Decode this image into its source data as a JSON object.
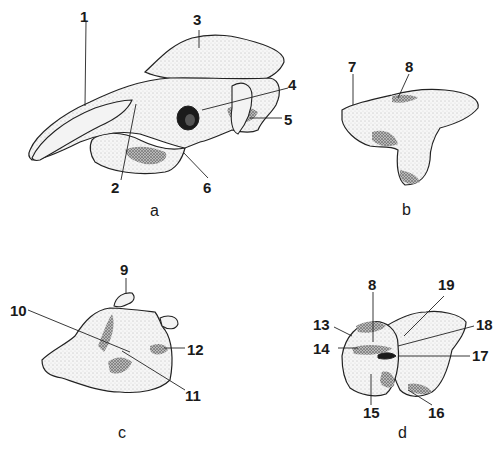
{
  "figure": {
    "type": "anatomical-illustration",
    "panels": [
      {
        "id": "a",
        "label": "a",
        "callouts": [
          "1",
          "2",
          "3",
          "4",
          "5",
          "6"
        ]
      },
      {
        "id": "b",
        "label": "b",
        "callouts": [
          "7",
          "8"
        ]
      },
      {
        "id": "c",
        "label": "c",
        "callouts": [
          "9",
          "10",
          "11",
          "12"
        ]
      },
      {
        "id": "d",
        "label": "d",
        "callouts": [
          "8",
          "13",
          "14",
          "15",
          "16",
          "17",
          "18",
          "19"
        ]
      }
    ]
  },
  "labels": {
    "a": {
      "panel": "a",
      "n1": "1",
      "n2": "2",
      "n3": "3",
      "n4": "4",
      "n5": "5",
      "n6": "6"
    },
    "b": {
      "panel": "b",
      "n7": "7",
      "n8": "8"
    },
    "c": {
      "panel": "c",
      "n9": "9",
      "n10": "10",
      "n11": "11",
      "n12": "12"
    },
    "d": {
      "panel": "d",
      "n8": "8",
      "n13": "13",
      "n14": "14",
      "n15": "15",
      "n16": "16",
      "n17": "17",
      "n18": "18",
      "n19": "19"
    }
  }
}
